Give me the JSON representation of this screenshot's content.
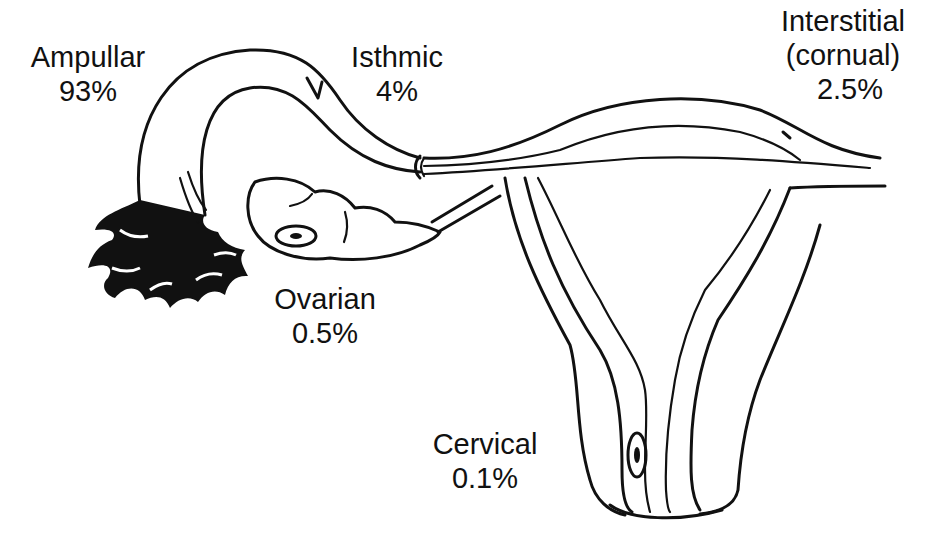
{
  "diagram": {
    "labels": [
      {
        "id": "ampullar",
        "name": "Ampullar",
        "percent": "93%"
      },
      {
        "id": "isthmic",
        "name": "Isthmic",
        "percent": "4%"
      },
      {
        "id": "interstitial",
        "name": "Interstitial",
        "subname": "(cornual)",
        "percent": "2.5%"
      },
      {
        "id": "ovarian",
        "name": "Ovarian",
        "percent": "0.5%"
      },
      {
        "id": "cervical",
        "name": "Cervical",
        "percent": "0.1%"
      }
    ],
    "colors": {
      "line": "#111111",
      "background": "#ffffff"
    }
  }
}
